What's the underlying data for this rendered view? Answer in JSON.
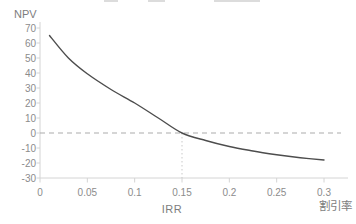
{
  "chart": {
    "y_axis_label": "NPV",
    "irr_label": "IRR",
    "x_axis_label": "割引率",
    "colors": {
      "curve": "#4d4d4d",
      "axis": "#d4d4d4",
      "tick_text": "#8c8c8c",
      "zero_dashed_line": "#ababab",
      "irr_guide_dotted_line": "#c9c9c9",
      "label_text": "#7d7d7d"
    }
  },
  "chart_data": {
    "type": "line",
    "title": "",
    "xlabel": "割引率",
    "ylabel": "NPV",
    "legend": false,
    "grid": false,
    "xlim": [
      0,
      0.325
    ],
    "ylim": [
      -30,
      70
    ],
    "x_ticks": [
      "0",
      "0.05",
      "0.1",
      "0.15",
      "0.2",
      "0.25",
      "0.3"
    ],
    "x_tick_values": [
      0,
      0.05,
      0.1,
      0.15,
      0.2,
      0.25,
      0.3
    ],
    "y_ticks": [
      "70",
      "60",
      "50",
      "40",
      "30",
      "20",
      "10",
      "0",
      "-10",
      "-20",
      "-30"
    ],
    "y_tick_values": [
      70,
      60,
      50,
      40,
      30,
      20,
      10,
      0,
      -10,
      -20,
      -30
    ],
    "x": [
      0.01,
      0.03,
      0.05,
      0.075,
      0.1,
      0.125,
      0.15,
      0.175,
      0.2,
      0.225,
      0.25,
      0.275,
      0.3
    ],
    "series": [
      {
        "name": "NPV",
        "values": [
          65,
          50,
          39.5,
          29,
          20,
          10,
          0,
          -5,
          -9,
          -12,
          -14.5,
          -16.5,
          -18
        ]
      }
    ],
    "annotations": {
      "zero_npv_dashed_line": 0,
      "irr_vertical_guide_x": 0.15,
      "irr_value": 0.15
    }
  }
}
